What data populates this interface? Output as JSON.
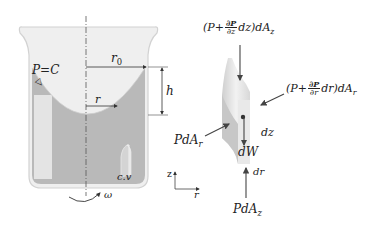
{
  "diagram": {
    "colors": {
      "liquid": "#b9b9b9",
      "glass": "#eeeeee",
      "glass_outline": "#d2d2d2",
      "arrow": "#444444",
      "text": "#222222"
    },
    "container": {
      "labels": {
        "pressure": "P=C",
        "free_surface_symbol": "▽",
        "outer_radius": "r",
        "outer_radius_sub": "0",
        "radius": "r",
        "height": "h",
        "control_volume": "c.v",
        "angular_velocity": "ω"
      }
    },
    "axes": {
      "z": "z",
      "r": "r"
    },
    "element": {
      "top_force": {
        "prefix": "(P+",
        "num": "∂P",
        "den": "∂z",
        "suffix": "dz)dA",
        "sub": "z"
      },
      "right_force": {
        "prefix": "(P+",
        "num": "∂P",
        "den": "∂r",
        "suffix": "dr)dA",
        "sub": "r"
      },
      "left_force": {
        "text": "PdA",
        "sub": "r"
      },
      "bottom_force": {
        "text": "PdA",
        "sub": "z"
      },
      "weight": "dW",
      "height": "dz",
      "width": "dr"
    }
  }
}
